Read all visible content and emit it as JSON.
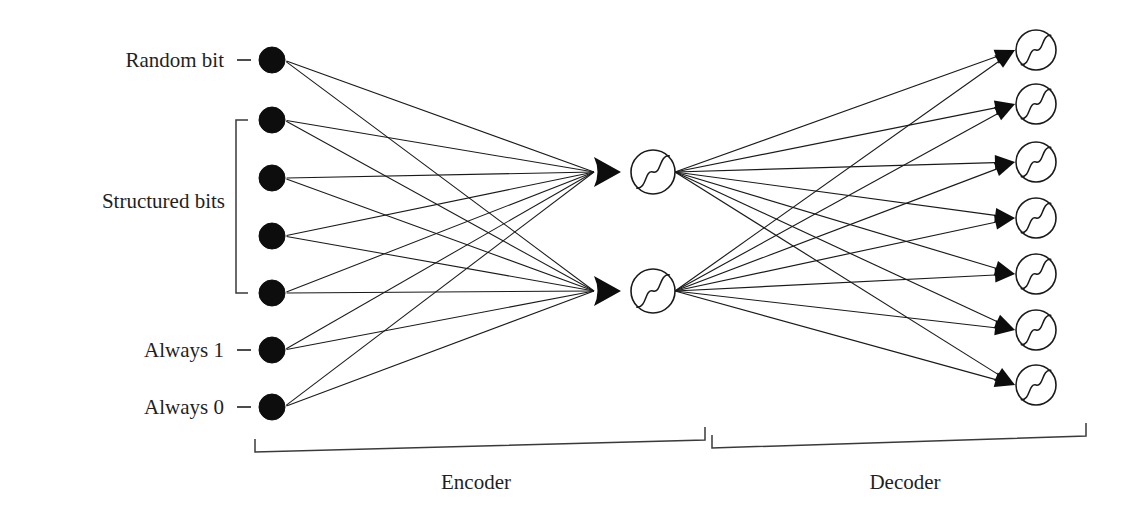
{
  "figure": {
    "background_color": "#ffffff",
    "ink_color": "#1a1a1a",
    "node_fill_input": "#0d0d0d",
    "node_fill_neuron": "#ffffff"
  },
  "input_layer": {
    "count": 7,
    "node_radius": 13,
    "x": 272,
    "nodes": [
      {
        "id": "in-1",
        "y": 60,
        "label": "Random bit",
        "has_dash": true
      },
      {
        "id": "in-2",
        "y": 120,
        "label": "",
        "has_dash": false
      },
      {
        "id": "in-3",
        "y": 178,
        "label": "",
        "has_dash": false
      },
      {
        "id": "in-4",
        "y": 236,
        "label": "",
        "has_dash": false
      },
      {
        "id": "in-5",
        "y": 293,
        "label": "",
        "has_dash": false
      },
      {
        "id": "in-6",
        "y": 350,
        "label": "Always 1",
        "has_dash": true
      },
      {
        "id": "in-7",
        "y": 407,
        "label": "Always 0",
        "has_dash": true
      }
    ],
    "group_bracket": {
      "label": "Structured bits",
      "label_x": 225,
      "label_y": 208,
      "x": 236,
      "y_top": 120,
      "y_bottom": 293,
      "tick_width": 12
    }
  },
  "hidden_layer": {
    "count": 2,
    "x": 653,
    "radius": 22,
    "nodes": [
      {
        "id": "hid-1",
        "y": 172,
        "activation": "sigmoid"
      },
      {
        "id": "hid-2",
        "y": 291,
        "activation": "sigmoid"
      }
    ]
  },
  "output_layer": {
    "count": 7,
    "x": 1036,
    "radius": 20,
    "nodes": [
      {
        "id": "out-1",
        "y": 50,
        "activation": "sigmoid"
      },
      {
        "id": "out-2",
        "y": 104,
        "activation": "sigmoid"
      },
      {
        "id": "out-3",
        "y": 162,
        "activation": "sigmoid"
      },
      {
        "id": "out-4",
        "y": 218,
        "activation": "sigmoid"
      },
      {
        "id": "out-5",
        "y": 274,
        "activation": "sigmoid"
      },
      {
        "id": "out-6",
        "y": 330,
        "activation": "sigmoid"
      },
      {
        "id": "out-7",
        "y": 385,
        "activation": "sigmoid"
      }
    ]
  },
  "connections": {
    "encoder_fully_connected": true,
    "decoder_fully_connected": true,
    "encoder_edge_count": 14,
    "decoder_edge_count": 14,
    "arrow_style_encoder": "merged-fan-arrowhead",
    "arrow_style_decoder": "individual-arrowhead"
  },
  "sections": [
    {
      "id": "encoder",
      "label": "Encoder",
      "label_x": 476,
      "label_y": 489,
      "bracket": {
        "x_left": 255,
        "x_right": 705,
        "y_left": 452,
        "y_right": 440,
        "tick_height": 13
      }
    },
    {
      "id": "decoder",
      "label": "Decoder",
      "label_x": 905,
      "label_y": 489,
      "bracket": {
        "x_left": 712,
        "x_right": 1086,
        "y_left": 448,
        "y_right": 436,
        "tick_height": 13
      }
    }
  ]
}
